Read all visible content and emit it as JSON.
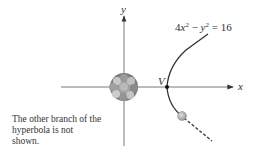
{
  "diagram": {
    "axes": {
      "x_label": "x",
      "y_label": "y"
    },
    "equation": {
      "coef": "4",
      "var1": "x",
      "exp1": "2",
      "op": " − ",
      "var2": "y",
      "exp2": "2",
      "rhs": " = 16"
    },
    "vertex_label": "V",
    "note": "The other branch of the hyperbola is not shown.",
    "colors": {
      "axis": "#555555",
      "curve": "#333333",
      "nucleus": "#8a8a8a",
      "particle": "#b0b0b0"
    }
  }
}
